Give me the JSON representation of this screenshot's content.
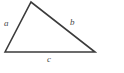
{
  "figure": {
    "kind": "geometry-diagram",
    "shape": "triangle",
    "background_color": "#ffffff",
    "stroke_color": "#3b3b3b",
    "stroke_width": 1.6,
    "label_color": "#4a4a4a",
    "width": 124,
    "height": 73,
    "vertices": [
      {
        "name": "left-vertex",
        "x": 5,
        "y": 52
      },
      {
        "name": "apex-vertex",
        "x": 31,
        "y": 2
      },
      {
        "name": "right-vertex",
        "x": 95,
        "y": 52
      }
    ],
    "polygon_points": "5,52 31,2 95,52",
    "sides": [
      {
        "id": "a",
        "label": "a",
        "from": "left-vertex",
        "to": "apex-vertex",
        "label_x": 4,
        "label_y": 19
      },
      {
        "id": "b",
        "label": "b",
        "from": "apex-vertex",
        "to": "right-vertex",
        "label_x": 70,
        "label_y": 18
      },
      {
        "id": "c",
        "label": "c",
        "from": "left-vertex",
        "to": "right-vertex",
        "label_x": 47,
        "label_y": 55
      }
    ]
  }
}
